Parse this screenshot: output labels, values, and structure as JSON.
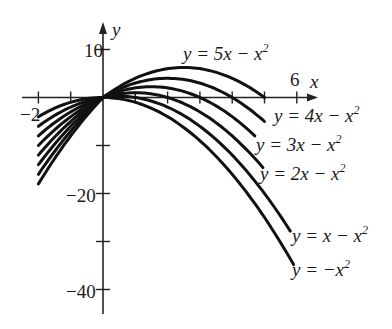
{
  "chart_data": {
    "type": "line",
    "title": "",
    "xlabel": "x",
    "ylabel": "y",
    "xlim": [
      -2,
      6
    ],
    "ylim": [
      -40,
      10
    ],
    "grid": false,
    "x_ticks": [
      -2,
      -1,
      0,
      1,
      2,
      3,
      4,
      5,
      6
    ],
    "x_tick_labels": {
      "-2": "−2",
      "6": "6"
    },
    "y_ticks": [
      10,
      -10,
      -20,
      -30,
      -40
    ],
    "y_tick_labels": {
      "10": "10",
      "-20": "−20",
      "-40": "−40"
    },
    "series": [
      {
        "name": "y = 5x − x^2",
        "k": 5,
        "x": [
          -2,
          -1,
          0,
          1,
          2,
          3,
          4,
          5,
          6
        ],
        "values": [
          -14,
          -6,
          0,
          4,
          6,
          6,
          4,
          0,
          -6
        ]
      },
      {
        "name": "y = 4x − x^2",
        "k": 4,
        "x": [
          -2,
          -1,
          0,
          1,
          2,
          3,
          4,
          5,
          6
        ],
        "values": [
          -12,
          -5,
          0,
          3,
          4,
          3,
          0,
          -5,
          -12
        ]
      },
      {
        "name": "y = 3x − x^2",
        "k": 3,
        "x": [
          -2,
          -1,
          0,
          1,
          2,
          3,
          4,
          5,
          6
        ],
        "values": [
          -10,
          -4,
          0,
          2,
          2,
          0,
          -4,
          -10,
          -18
        ]
      },
      {
        "name": "y = 2x − x^2",
        "k": 2,
        "x": [
          -2,
          -1,
          0,
          1,
          2,
          3,
          4,
          5,
          6
        ],
        "values": [
          -8,
          -3,
          0,
          1,
          0,
          -3,
          -8,
          -15,
          -24
        ]
      },
      {
        "name": "y = x − x^2",
        "k": 1,
        "x": [
          -2,
          -1,
          0,
          1,
          2,
          3,
          4,
          5,
          6
        ],
        "values": [
          -6,
          -2,
          0,
          0,
          -2,
          -6,
          -12,
          -20,
          -30
        ]
      },
      {
        "name": "y = −x^2",
        "k": 0,
        "x": [
          -2,
          -1,
          0,
          1,
          2,
          3,
          4,
          5,
          6
        ],
        "values": [
          -4,
          -1,
          0,
          -1,
          -4,
          -9,
          -16,
          -25,
          -36
        ]
      }
    ],
    "extra_left_curves": [
      6,
      7
    ]
  },
  "labels": {
    "x_axis": "x",
    "y_axis": "y",
    "tick_10": "10",
    "tick_neg2": "−2",
    "tick_6": "6",
    "tick_neg20": "−20",
    "tick_neg40": "−40",
    "curve5": "y = 5x − x",
    "curve4": "y = 4x − x",
    "curve3": "y = 3x − x",
    "curve2": "y = 2x − x",
    "curve1": "y = x − x",
    "curve0": "y = −x",
    "sq": "2"
  }
}
